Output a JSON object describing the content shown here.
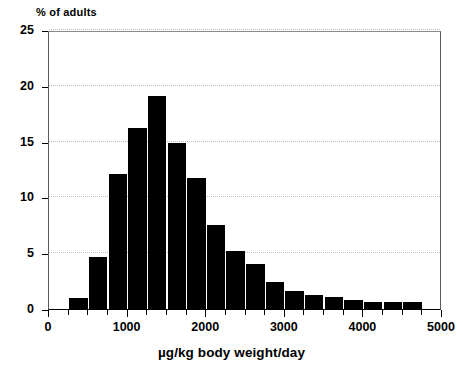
{
  "chart_data": {
    "type": "bar",
    "title": "",
    "ylabel": "% of adults",
    "xlabel": "µg/kg body weight/day",
    "xlim": [
      0,
      5000
    ],
    "ylim": [
      0,
      25
    ],
    "grid": true,
    "legend": null,
    "bar_color": "#000000",
    "bin_width": 250,
    "y_ticks": [
      0,
      5,
      10,
      15,
      20,
      25
    ],
    "y_tick_labels": [
      "0",
      "5",
      "10",
      "15",
      "20",
      "25"
    ],
    "x_ticks": [
      0,
      1000,
      2000,
      3000,
      4000,
      5000
    ],
    "x_tick_labels": [
      "0",
      "1000",
      "2000",
      "3000",
      "4000",
      "5000"
    ],
    "x_minor_tick_step": 250,
    "categories": [
      "250-500",
      "500-750",
      "750-1000",
      "1000-1250",
      "1250-1500",
      "1500-1750",
      "1750-2000",
      "2000-2250",
      "2250-2500",
      "2500-2750",
      "2750-3000",
      "3000-3250",
      "3250-3500",
      "3500-3750",
      "3750-4000",
      "4000-4250",
      "4250-4500",
      "4500-4750"
    ],
    "bin_starts": [
      250,
      500,
      750,
      1000,
      1250,
      1500,
      1750,
      2000,
      2250,
      2500,
      2750,
      3000,
      3250,
      3500,
      3750,
      4000,
      4250,
      4500
    ],
    "values": [
      1.0,
      4.7,
      12.1,
      16.2,
      19.1,
      14.9,
      11.7,
      7.5,
      5.2,
      4.0,
      2.4,
      1.6,
      1.3,
      1.1,
      0.85,
      0.6,
      0.6,
      0.6
    ]
  },
  "axes": {
    "y_title": "% of adults",
    "x_title": "µg/kg body weight/day"
  }
}
